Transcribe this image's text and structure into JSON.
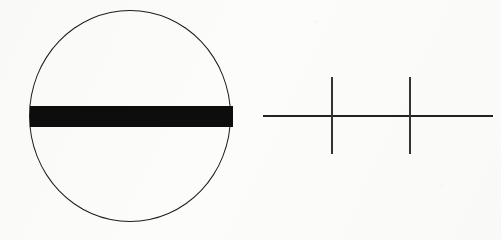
{
  "figure": {
    "title": "",
    "background_color": "#fcfcfb",
    "ink_color": "#0d0d0d",
    "width": 501,
    "height": 240,
    "panels": [
      {
        "id": "ellipse-figure",
        "name": "circle-with-horizontal-band",
        "description": "Thin outlined circle bisected by a thick solid black horizontal band",
        "shapes": [
          {
            "kind": "ellipse",
            "name": "circle-outline",
            "center_x": 130,
            "center_y": 116,
            "radius_x": 101,
            "radius_y": 106,
            "stroke_color": "#1c1c1c",
            "stroke_width": 1.15,
            "fill": "none"
          },
          {
            "kind": "rect",
            "name": "horizontal-band",
            "x": 30,
            "y": 106,
            "width": 203,
            "height": 21,
            "fill": "#0d0d0d",
            "stroke": "none"
          }
        ]
      },
      {
        "id": "cross-figure",
        "name": "line-with-two-vertical-ticks",
        "description": "Thin horizontal line crossed by two thin vertical tick marks",
        "shapes": [
          {
            "kind": "line",
            "name": "horizontal-axis-line",
            "x1": 263,
            "y1": 116,
            "x2": 493,
            "y2": 116,
            "stroke_color": "#222222",
            "stroke_width": 2.1
          },
          {
            "kind": "line",
            "name": "vertical-tick-1",
            "x1": 332,
            "y1": 77,
            "x2": 332,
            "y2": 154,
            "stroke_color": "#333333",
            "stroke_width": 1.5
          },
          {
            "kind": "line",
            "name": "vertical-tick-2",
            "x1": 410,
            "y1": 77,
            "x2": 410,
            "y2": 154,
            "stroke_color": "#333333",
            "stroke_width": 1.5
          }
        ]
      }
    ],
    "labels": []
  }
}
